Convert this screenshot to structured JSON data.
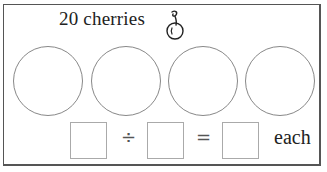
{
  "title": "20 cherries",
  "icon": "cherry-icon",
  "groups": [
    {
      "id": "group-1"
    },
    {
      "id": "group-2"
    },
    {
      "id": "group-3"
    },
    {
      "id": "group-4"
    }
  ],
  "equation": {
    "operand1": "",
    "divide_symbol": "÷",
    "operand2": "",
    "equals_symbol": "=",
    "result": "",
    "suffix": "each"
  },
  "colors": {
    "frame": "#555555",
    "circle": "#888888",
    "box": "#aaaaaa",
    "text": "#222222"
  }
}
